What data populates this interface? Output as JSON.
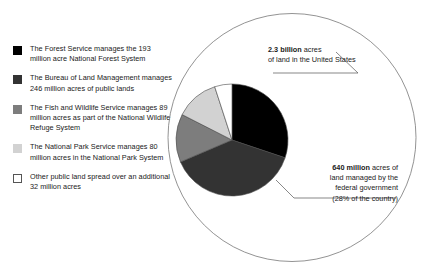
{
  "chart_data": {
    "type": "pie",
    "title": "",
    "unit": "million acres",
    "total_federal_acres_millions": 640,
    "categories": [
      "The Forest Service",
      "The Bureau of Land Management",
      "The Fish and Wildlife Service",
      "The National Park Service",
      "Other public land"
    ],
    "values": [
      193,
      246,
      89,
      80,
      32
    ],
    "colors": [
      "#000000",
      "#333333",
      "#7d7d7d",
      "#d2d2d2",
      "#ffffff"
    ],
    "start_angle_deg": 0,
    "direction": "clockwise",
    "legend_position": "left",
    "grid": false,
    "annotations": [
      "2.3 billion acres of land in the United States",
      "640 million acres of land managed by the federal government (28% of the country)"
    ]
  },
  "legend": {
    "items": [
      {
        "swatch_color": "#000000",
        "swatch_style": "filled",
        "name": "forest-service",
        "text": "The Forest Service manages the 193 million acre National Forest System"
      },
      {
        "swatch_color": "#333333",
        "swatch_style": "filled",
        "name": "bureau-of-land-management",
        "text": "The Bureau of Land Management manages 246 million acres of public lands"
      },
      {
        "swatch_color": "#7d7d7d",
        "swatch_style": "filled",
        "name": "fish-and-wildlife-service",
        "text": "The Fish and Wildlife Service manages 89 million acres as part of the National Wildlife Refuge System"
      },
      {
        "swatch_color": "#d2d2d2",
        "swatch_style": "filled",
        "name": "national-park-service",
        "text": "The National Park Service manages 80 million acres in the National Park System"
      },
      {
        "swatch_color": "#ffffff",
        "swatch_style": "outlined",
        "name": "other-public-land",
        "text": "Other public land spread over an additional 32 million acres"
      }
    ]
  },
  "callouts": {
    "total": {
      "bold": "2.3 billion",
      "rest": " acres",
      "line2": "of land in the United States"
    },
    "federal": {
      "bold": "640 million",
      "rest": " acres of",
      "line2": "land managed by the",
      "line3": "federal government",
      "line4": "(28% of the country)"
    }
  }
}
